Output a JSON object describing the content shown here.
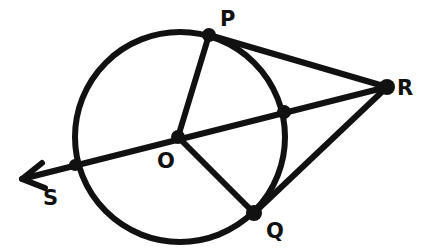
{
  "diagram": {
    "title": "",
    "stroke_color": "#111111",
    "background": "#ffffff",
    "circle": {
      "center": "O",
      "cx": 180,
      "cy": 137,
      "r": 105
    },
    "points": {
      "P": {
        "label": "P",
        "x": 209,
        "y": 35,
        "lx": 220,
        "ly": 26
      },
      "R": {
        "label": "R",
        "x": 387,
        "y": 87,
        "lx": 397,
        "ly": 95
      },
      "Q": {
        "label": "Q",
        "x": 254,
        "y": 213,
        "lx": 266,
        "ly": 236
      },
      "S": {
        "label": "S",
        "x": 75,
        "y": 165,
        "lx": 43,
        "ly": 204
      },
      "O": {
        "label": "O",
        "x": 178,
        "y": 137,
        "lx": 158,
        "ly": 167
      },
      "T": {
        "label": "",
        "x": 284,
        "y": 112
      }
    },
    "segments": [
      {
        "name": "radius-OP",
        "from": "O",
        "to": "P"
      },
      {
        "name": "radius-OQ",
        "from": "O",
        "to": "Q"
      },
      {
        "name": "tangent-PR",
        "from": "P",
        "to": "R"
      },
      {
        "name": "tangent-QR",
        "from": "Q",
        "to": "R"
      }
    ],
    "ray": {
      "name": "ray-RS",
      "from": "R",
      "through": "S",
      "tip_x": 22,
      "tip_y": 179
    }
  }
}
